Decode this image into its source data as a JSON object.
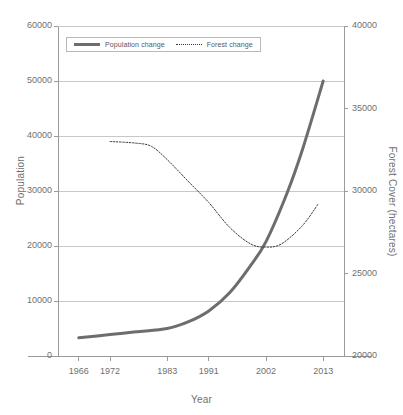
{
  "chart_data": {
    "type": "line",
    "title": "",
    "xlabel": "Year",
    "ylabel": "Population",
    "y2label": "Forest Cover (hectares)",
    "grid": true,
    "legend_position": "top-left",
    "x_tick_labels": [
      "1966",
      "1972",
      "1983",
      "1991",
      "2002",
      "2013"
    ],
    "x_tick_values": [
      1966,
      1972,
      1983,
      1991,
      2002,
      2013
    ],
    "xlim": [
      1962,
      2017
    ],
    "y_tick_labels": [
      "0",
      "10000",
      "20000",
      "30000",
      "40000",
      "50000",
      "60000"
    ],
    "y_tick_values": [
      0,
      10000,
      20000,
      30000,
      40000,
      50000,
      60000
    ],
    "ylim": [
      0,
      60000
    ],
    "y2_tick_labels": [
      "20000",
      "25000",
      "30000",
      "35000",
      "40000"
    ],
    "y2_tick_values": [
      20000,
      25000,
      30000,
      35000,
      40000
    ],
    "y2lim": [
      20000,
      40000
    ],
    "series": [
      {
        "name": "Population change",
        "axis": "left",
        "style": "solid",
        "color": "#6d6d6d",
        "width": 3,
        "x": [
          1966,
          1972,
          1977,
          1983,
          1987,
          1991,
          1995,
          1999,
          2002,
          2006,
          2009,
          2013
        ],
        "values": [
          3300,
          3900,
          4400,
          5000,
          6200,
          8200,
          11500,
          16400,
          20800,
          29500,
          37500,
          50000
        ]
      },
      {
        "name": "Forest change",
        "axis": "right",
        "style": "dotted",
        "color": "#3a3a3a",
        "width": 1,
        "x": [
          1972,
          1977,
          1980,
          1983,
          1987,
          1991,
          1995,
          1999,
          2002,
          2005,
          2009,
          2012
        ],
        "values": [
          33000,
          32900,
          32700,
          31900,
          30600,
          29300,
          27800,
          26800,
          26600,
          26800,
          27900,
          29200
        ]
      }
    ]
  },
  "legend": {
    "items": [
      {
        "label": "Population change",
        "style": "solid"
      },
      {
        "label": "Forest change",
        "style": "dotted"
      }
    ]
  },
  "colors": {
    "population_line": "#6d6d6d",
    "forest_line": "#3a3a3a",
    "grid": "#c8c8c8",
    "axis": "#9a9a9a",
    "text": "#6f6f6f"
  }
}
